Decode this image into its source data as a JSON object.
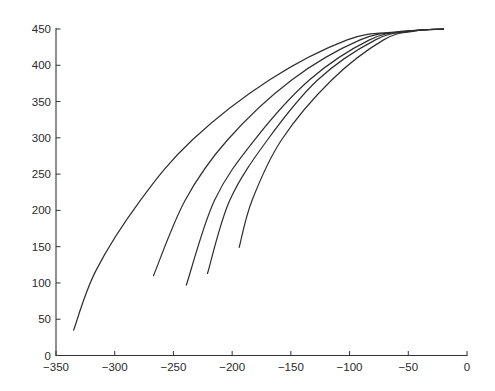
{
  "chart_data": {
    "type": "line",
    "title": "",
    "xlabel": "",
    "ylabel": "",
    "xlim": [
      -350,
      0
    ],
    "ylim": [
      0,
      450
    ],
    "grid": false,
    "legend": null,
    "x_ticks": [
      -350,
      -300,
      -250,
      -200,
      -150,
      -100,
      -50,
      0
    ],
    "x_tick_labels": [
      "−350",
      "−300",
      "−250",
      "−200",
      "−150",
      "−100",
      "−50",
      "0"
    ],
    "y_ticks": [
      0,
      50,
      100,
      150,
      200,
      250,
      300,
      350,
      400,
      450
    ],
    "y_tick_labels": [
      "0",
      "50",
      "100",
      "150",
      "200",
      "250",
      "300",
      "350",
      "400",
      "450"
    ],
    "series": [
      {
        "name": "curve-1",
        "points": [
          [
            -335,
            35
          ],
          [
            -316,
            117
          ],
          [
            -278,
            214
          ],
          [
            -234,
            297
          ],
          [
            -168,
            380
          ],
          [
            -102,
            435
          ],
          [
            -60,
            446
          ],
          [
            -20,
            450
          ]
        ]
      },
      {
        "name": "curve-2",
        "points": [
          [
            -267,
            110
          ],
          [
            -240,
            214
          ],
          [
            -204,
            297
          ],
          [
            -149,
            380
          ],
          [
            -91,
            435
          ],
          [
            -55,
            446
          ],
          [
            -20,
            450
          ]
        ]
      },
      {
        "name": "curve-3",
        "points": [
          [
            -239,
            97
          ],
          [
            -215,
            214
          ],
          [
            -181,
            297
          ],
          [
            -134,
            380
          ],
          [
            -83,
            435
          ],
          [
            -50,
            447
          ],
          [
            -20,
            450
          ]
        ]
      },
      {
        "name": "curve-4",
        "points": [
          [
            -221,
            113
          ],
          [
            -202,
            214
          ],
          [
            -170,
            297
          ],
          [
            -127,
            380
          ],
          [
            -78,
            435
          ],
          [
            -48,
            447
          ],
          [
            -20,
            450
          ]
        ]
      },
      {
        "name": "curve-5",
        "points": [
          [
            -194,
            149
          ],
          [
            -183,
            214
          ],
          [
            -158,
            297
          ],
          [
            -115,
            380
          ],
          [
            -71,
            435
          ],
          [
            -45,
            447
          ],
          [
            -20,
            450
          ]
        ]
      }
    ]
  }
}
